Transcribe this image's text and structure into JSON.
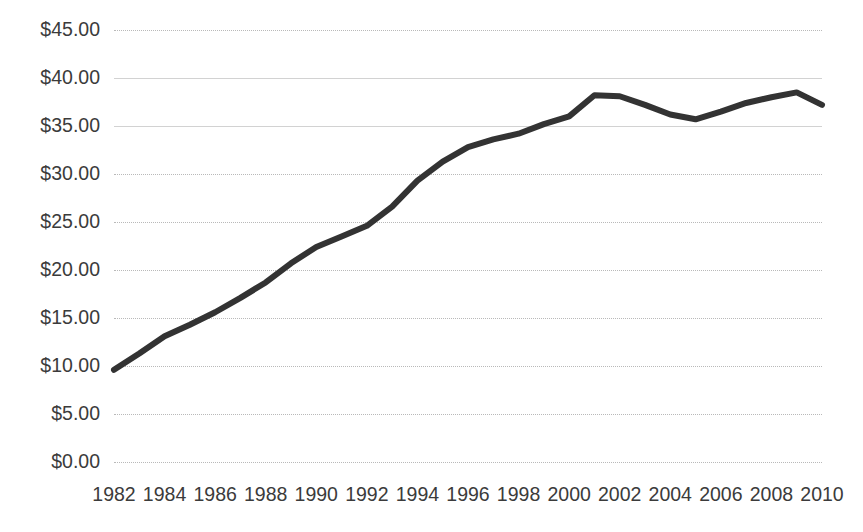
{
  "chart_data": {
    "type": "line",
    "title": "",
    "subtitle": "",
    "xlabel": "",
    "ylabel": "",
    "xlim": [
      1982,
      2010
    ],
    "ylim": [
      0,
      45
    ],
    "grid": true,
    "legend": false,
    "legend_position": "none",
    "line_color": "#333333",
    "x_tick_labels": [
      "1982",
      "1984",
      "1986",
      "1988",
      "1990",
      "1992",
      "1994",
      "1996",
      "1998",
      "2000",
      "2002",
      "2004",
      "2006",
      "2008",
      "2010"
    ],
    "y_tick_labels": [
      "$45.00",
      "$40.00",
      "$35.00",
      "$30.00",
      "$25.00",
      "$20.00",
      "$15.00",
      "$10.00",
      "$5.00",
      "$0.00"
    ],
    "y_tick_values": [
      45,
      40,
      35,
      30,
      25,
      20,
      15,
      10,
      5,
      0
    ],
    "series": [
      {
        "name": "Value",
        "x": [
          1982,
          1983,
          1984,
          1985,
          1986,
          1987,
          1988,
          1989,
          1990,
          1991,
          1992,
          1993,
          1994,
          1995,
          1996,
          1997,
          1998,
          1999,
          2000,
          2001,
          2002,
          2003,
          2004,
          2005,
          2006,
          2007,
          2008,
          2009,
          2010
        ],
        "values": [
          9.6,
          11.3,
          13.1,
          14.3,
          15.6,
          17.1,
          18.7,
          20.7,
          22.4,
          23.5,
          24.6,
          26.6,
          29.3,
          31.3,
          32.8,
          33.6,
          34.2,
          35.2,
          36.0,
          38.2,
          38.1,
          37.2,
          36.2,
          35.7,
          36.5,
          37.4,
          38.0,
          38.5,
          37.2
        ]
      }
    ]
  }
}
